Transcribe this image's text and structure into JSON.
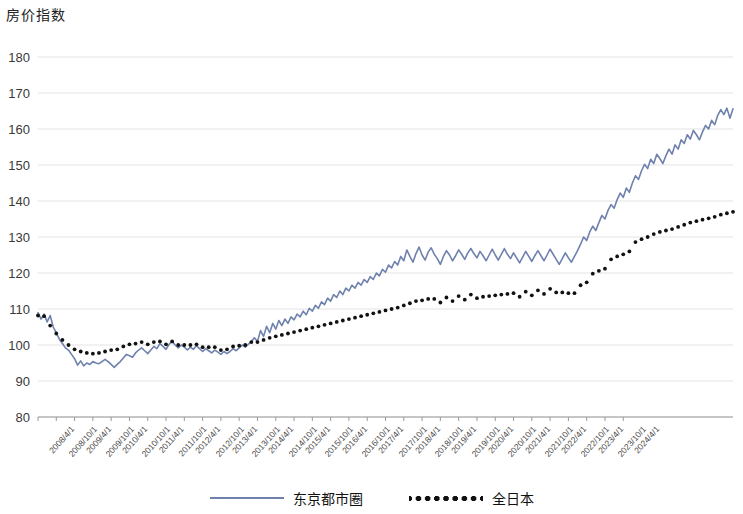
{
  "chart_data": {
    "type": "line",
    "title": "房价指数",
    "xlabel": "",
    "ylabel": "房价指数",
    "ylim": [
      80,
      180
    ],
    "ytick_step": 10,
    "yticks": [
      "180",
      "170",
      "160",
      "150",
      "140",
      "130",
      "120",
      "110",
      "100",
      "90",
      "80"
    ],
    "grid": true,
    "legend_position": "bottom-center",
    "x_tick_labels": [
      "2008/4/1",
      "2008/10/1",
      "2009/4/1",
      "2009/10/1",
      "2010/4/1",
      "2010/10/1",
      "2011/4/1",
      "2011/10/1",
      "2012/4/1",
      "2012/10/1",
      "2013/4/1",
      "2013/10/1",
      "2014/4/1",
      "2014/10/1",
      "2015/4/1",
      "2015/10/1",
      "2016/4/1",
      "2016/10/1",
      "2017/4/1",
      "2017/10/1",
      "2018/4/1",
      "2018/10/1",
      "2019/4/1",
      "2019/10/1",
      "2020/4/1",
      "2020/10/1",
      "2021/4/1",
      "2021/10/1",
      "2022/4/1",
      "2022/10/1",
      "2023/4/1",
      "2023/10/1",
      "2024/4/1"
    ],
    "x_start": "2008/4/1",
    "x_end": "2024/4/1",
    "x_frequency": "monthly",
    "series": [
      {
        "name": "东京都市圈",
        "color": "#6f81ad",
        "style": "solid",
        "values": [
          109.0,
          107.2,
          108.6,
          106.4,
          108.2,
          105.0,
          103.4,
          101.6,
          100.4,
          99.2,
          98.6,
          97.4,
          96.2,
          94.4,
          95.6,
          94.2,
          95.0,
          94.6,
          95.4,
          95.0,
          94.8,
          95.4,
          96.0,
          95.4,
          94.6,
          93.8,
          94.6,
          95.4,
          96.4,
          97.4,
          97.0,
          96.6,
          97.8,
          98.6,
          99.2,
          98.4,
          97.6,
          98.6,
          99.6,
          99.0,
          100.4,
          99.6,
          98.8,
          100.2,
          101.0,
          100.0,
          99.2,
          100.0,
          99.4,
          98.6,
          99.4,
          98.8,
          99.8,
          99.0,
          98.2,
          99.0,
          98.4,
          97.8,
          98.6,
          98.0,
          97.4,
          98.2,
          97.6,
          98.2,
          99.0,
          98.4,
          99.2,
          100.0,
          99.4,
          100.2,
          101.0,
          102.0,
          101.0,
          104.0,
          102.4,
          105.2,
          103.4,
          106.0,
          104.4,
          106.8,
          105.4,
          107.2,
          106.0,
          107.8,
          107.0,
          108.6,
          107.8,
          109.4,
          108.4,
          110.2,
          109.4,
          111.0,
          110.2,
          112.0,
          111.2,
          113.0,
          112.2,
          114.0,
          113.2,
          115.0,
          114.0,
          115.8,
          115.0,
          116.6,
          115.8,
          117.4,
          116.6,
          118.2,
          117.4,
          119.0,
          118.2,
          120.0,
          119.2,
          121.0,
          120.2,
          122.2,
          121.4,
          123.2,
          122.2,
          124.6,
          123.4,
          126.4,
          124.6,
          123.0,
          125.4,
          127.2,
          125.0,
          123.6,
          125.8,
          127.0,
          125.2,
          124.0,
          122.4,
          124.6,
          126.2,
          125.0,
          123.4,
          124.8,
          126.4,
          125.2,
          123.8,
          125.6,
          126.8,
          125.4,
          124.2,
          126.0,
          124.8,
          123.4,
          125.0,
          126.6,
          125.0,
          123.6,
          125.2,
          126.8,
          125.2,
          124.0,
          125.6,
          124.2,
          122.8,
          124.4,
          126.0,
          124.6,
          123.2,
          124.8,
          126.2,
          124.8,
          123.4,
          125.0,
          126.6,
          125.2,
          123.8,
          122.4,
          124.0,
          125.6,
          124.2,
          123.0,
          124.6,
          126.2,
          128.0,
          130.0,
          129.0,
          131.4,
          133.0,
          131.8,
          134.0,
          136.0,
          135.0,
          137.4,
          139.0,
          138.0,
          140.4,
          142.2,
          141.0,
          143.6,
          142.4,
          145.0,
          147.0,
          146.0,
          148.4,
          150.2,
          149.0,
          151.6,
          150.4,
          153.0,
          151.8,
          150.4,
          152.6,
          154.4,
          153.0,
          155.6,
          154.4,
          157.0,
          156.0,
          158.4,
          157.2,
          159.6,
          158.4,
          157.0,
          159.2,
          161.0,
          160.0,
          162.4,
          161.2,
          163.8,
          165.4,
          164.0,
          165.8,
          163.0,
          165.6
        ]
      },
      {
        "name": "全日本",
        "color": "#111111",
        "style": "dotted",
        "values": [
          108.2,
          107.4,
          108.0,
          106.2,
          105.4,
          104.0,
          103.2,
          102.2,
          101.4,
          100.6,
          100.0,
          99.4,
          98.8,
          98.4,
          98.2,
          98.0,
          97.8,
          97.8,
          97.6,
          97.8,
          97.8,
          98.0,
          98.2,
          98.4,
          98.6,
          98.6,
          98.8,
          99.2,
          99.6,
          100.0,
          100.2,
          100.0,
          100.4,
          100.6,
          100.8,
          100.4,
          100.2,
          100.4,
          100.8,
          100.6,
          101.0,
          100.6,
          100.2,
          100.6,
          101.0,
          100.4,
          100.0,
          100.4,
          100.0,
          99.6,
          100.0,
          99.6,
          100.2,
          99.8,
          99.4,
          99.8,
          99.4,
          99.0,
          99.4,
          99.0,
          98.6,
          99.0,
          98.8,
          99.2,
          99.6,
          99.4,
          99.8,
          100.2,
          100.0,
          100.4,
          100.8,
          101.2,
          100.8,
          102.0,
          101.4,
          102.6,
          102.0,
          103.0,
          102.4,
          103.4,
          102.8,
          103.8,
          103.2,
          104.2,
          103.6,
          104.6,
          104.0,
          105.0,
          104.4,
          105.4,
          104.8,
          105.8,
          105.2,
          106.2,
          105.6,
          106.6,
          106.0,
          107.0,
          106.4,
          107.4,
          106.8,
          107.8,
          107.2,
          108.2,
          107.6,
          108.6,
          108.0,
          109.0,
          108.4,
          109.4,
          108.8,
          109.8,
          109.2,
          110.2,
          109.6,
          110.6,
          110.0,
          111.0,
          110.4,
          111.6,
          111.0,
          112.2,
          111.6,
          111.0,
          112.2,
          113.0,
          112.4,
          111.8,
          112.8,
          113.4,
          112.8,
          112.2,
          111.8,
          112.6,
          113.2,
          112.8,
          112.2,
          113.0,
          113.6,
          113.2,
          112.6,
          113.4,
          114.0,
          113.4,
          113.0,
          113.8,
          113.4,
          112.8,
          113.6,
          114.2,
          113.8,
          113.2,
          114.0,
          114.6,
          114.2,
          113.6,
          114.4,
          114.0,
          113.4,
          114.2,
          114.8,
          114.4,
          113.8,
          114.6,
          115.2,
          114.8,
          114.2,
          115.0,
          115.6,
          115.2,
          114.6,
          113.8,
          114.6,
          115.2,
          114.4,
          113.6,
          114.4,
          115.4,
          116.6,
          118.0,
          117.4,
          118.8,
          119.8,
          119.2,
          120.6,
          121.8,
          121.2,
          122.6,
          123.8,
          123.2,
          124.6,
          125.8,
          125.2,
          126.6,
          126.0,
          127.4,
          128.6,
          128.0,
          129.4,
          130.6,
          130.0,
          131.4,
          130.8,
          132.0,
          131.4,
          130.8,
          131.8,
          132.8,
          132.2,
          133.4,
          132.8,
          134.0,
          133.4,
          134.6,
          134.0,
          135.0,
          134.4,
          133.8,
          134.8,
          135.8,
          135.2,
          136.2,
          135.6,
          136.6,
          136.2,
          135.6,
          136.6,
          135.8,
          137.0
        ]
      }
    ]
  },
  "legend": {
    "items": [
      {
        "label": "东京都市圈",
        "style": "solid"
      },
      {
        "label": "全日本",
        "style": "dotted"
      }
    ]
  }
}
